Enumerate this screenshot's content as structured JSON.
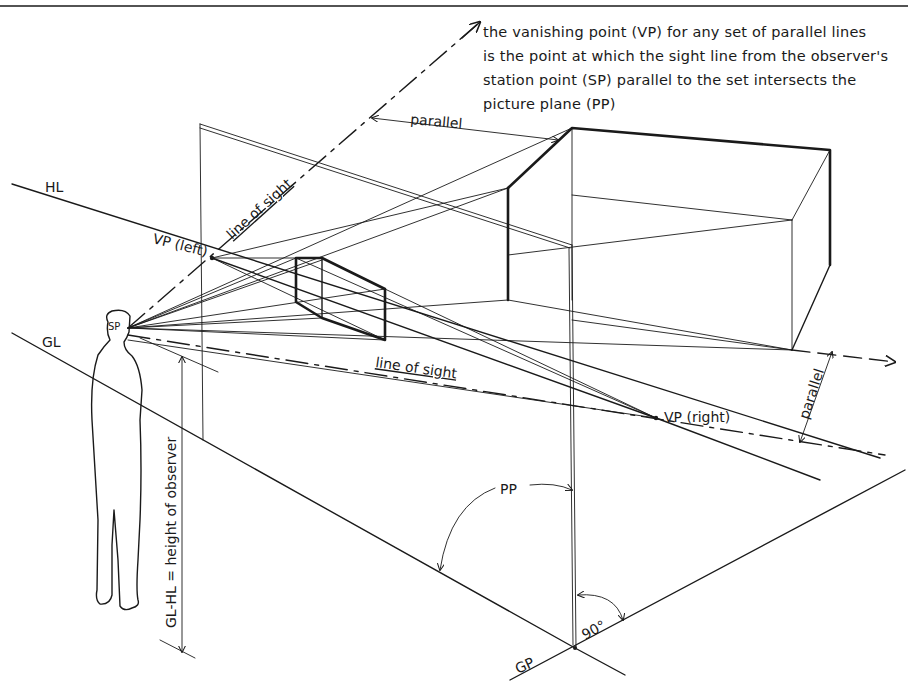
{
  "diagram": {
    "title_note": {
      "lines": [
        "the vanishing point (VP) for any set of parallel lines",
        "is the point at which the sight line from the observer's",
        "station point (SP) parallel to the set intersects the",
        "picture plane (PP)"
      ]
    },
    "labels": {
      "hl": "HL",
      "gl": "GL",
      "gp": "GP",
      "pp": "PP",
      "sp": "SP",
      "vp_left": "VP (left)",
      "vp_right": "VP (right)",
      "line_of_sight_upper": "line of sight",
      "line_of_sight_lower": "line of sight",
      "parallel_top": "parallel",
      "parallel_right": "parallel",
      "height_of_observer": "GL-HL = height of observer",
      "angle_90": "90°"
    },
    "colors": {
      "ink": "#1a1a1a",
      "background": "#ffffff"
    }
  }
}
